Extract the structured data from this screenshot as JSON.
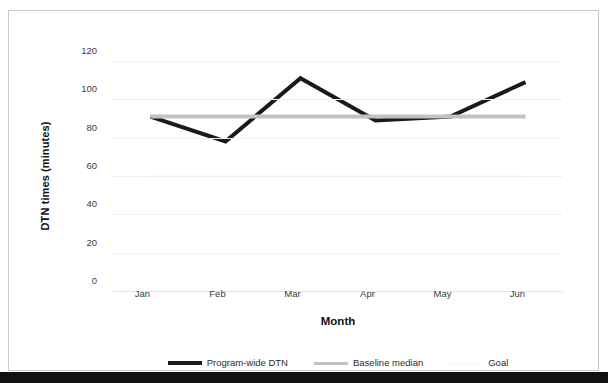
{
  "figure": {
    "background_color": "#ffffff",
    "border_color": "#c9c9c9",
    "bottom_bar_color": "#111111"
  },
  "axes": {
    "y_title": "DTN times (minutes)",
    "x_title": "Month"
  },
  "legend": {
    "items": [
      {
        "label": "Program-wide DTN",
        "color": "#1a1a1a",
        "style": "thick"
      },
      {
        "label": "Baseline median",
        "color": "#c2c2c2",
        "style": "thin"
      },
      {
        "label": "Goal",
        "color": "#fbfbfb",
        "style": "thin"
      }
    ]
  },
  "chart_data": {
    "type": "line",
    "title": "",
    "subtitle": "",
    "xlabel": "Month",
    "ylabel": "DTN times (minutes)",
    "categories": [
      "Jan",
      "Feb",
      "Mar",
      "Apr",
      "May",
      "Jun"
    ],
    "ylim": [
      0,
      120
    ],
    "yticks": [
      0,
      20,
      40,
      60,
      80,
      100,
      120
    ],
    "ytick_labels": [
      "0",
      "20",
      "40",
      "60",
      "80",
      "100",
      "120"
    ],
    "grid": "horizontal",
    "legend_position": "bottom",
    "series": [
      {
        "name": "Program-wide DTN",
        "color": "#1a1a1a",
        "width": 4,
        "values": [
          91,
          78,
          111,
          89,
          91,
          109
        ]
      },
      {
        "name": "Baseline median",
        "color": "#c2c2c2",
        "width": 4,
        "values": [
          91,
          91,
          91,
          91,
          91,
          91
        ]
      },
      {
        "name": "Goal",
        "color": "#fbfbfb",
        "width": 3,
        "values": [
          60,
          60,
          60,
          60,
          60,
          60
        ]
      }
    ]
  }
}
